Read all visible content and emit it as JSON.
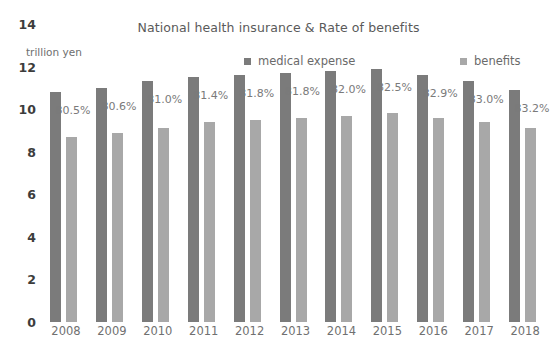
{
  "chart_data": {
    "type": "bar",
    "title": "National health insurance & Rate of benefits",
    "xlabel": "",
    "ylabel": "trillion yen",
    "ylim": [
      0,
      14
    ],
    "yticks": [
      0,
      2,
      4,
      6,
      8,
      10,
      12,
      14
    ],
    "grid": false,
    "legend_position": "top",
    "categories": [
      "2008",
      "2009",
      "2010",
      "2011",
      "2012",
      "2013",
      "2014",
      "2015",
      "2016",
      "2017",
      "2018"
    ],
    "series": [
      {
        "name": "medical expense",
        "color": "#7b7b7b",
        "values": [
          10.8,
          11.0,
          11.3,
          11.5,
          11.6,
          11.7,
          11.8,
          11.9,
          11.6,
          11.3,
          10.9
        ]
      },
      {
        "name": "benefits",
        "color": "#a8a8a8",
        "values": [
          8.7,
          8.9,
          9.1,
          9.4,
          9.5,
          9.6,
          9.7,
          9.8,
          9.6,
          9.4,
          9.1
        ]
      }
    ],
    "annotations": {
      "label": "Rate of benefits",
      "values": [
        "80.5%",
        "80.6%",
        "81.0%",
        "81.4%",
        "81.8%",
        "81.8%",
        "82.0%",
        "82.5%",
        "82.9%",
        "83.0%",
        "83.2%"
      ]
    }
  },
  "colors": {
    "series_medical": "#7b7b7b",
    "series_benefits": "#a8a8a8",
    "title_text": "#5a5a5a",
    "axis_text": "#3c3c3c",
    "annotation_text": "#7a7a7a",
    "background": "#ffffff"
  }
}
